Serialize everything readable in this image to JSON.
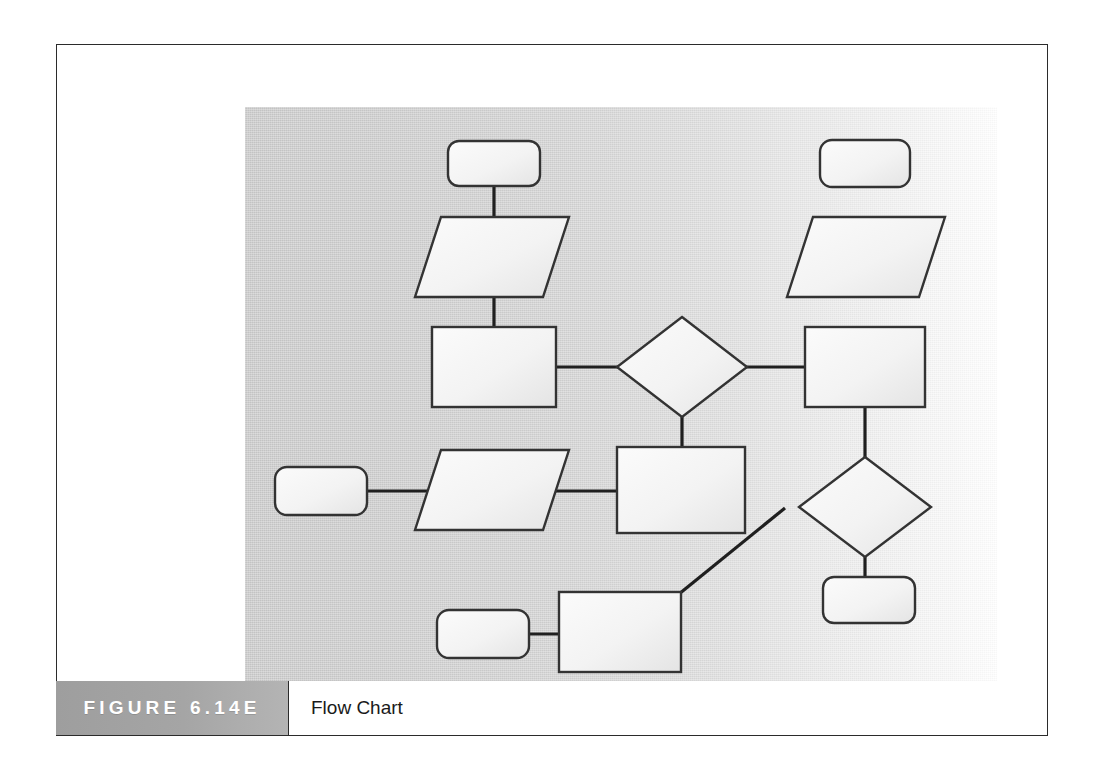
{
  "figure": {
    "badge_label": "FIGURE 6.14E",
    "caption": "Flow Chart",
    "badge_bg": "#a3a3a3",
    "badge_text_color": "#ffffff",
    "frame_border_color": "#2b2b2b"
  },
  "artwork": {
    "panel_fill_left": "#c9c9c9",
    "panel_fill_right": "#ffffff",
    "shape_fill": "#f2f2f2",
    "shape_stroke": "#333333",
    "connector_color": "#1f1f1f"
  },
  "diagram": {
    "type": "flowchart",
    "title": "Flow Chart",
    "symbol_legend": [
      {
        "symbol": "rounded-rectangle",
        "meaning": "terminator"
      },
      {
        "symbol": "parallelogram",
        "meaning": "input-output"
      },
      {
        "symbol": "rectangle",
        "meaning": "process"
      },
      {
        "symbol": "diamond",
        "meaning": "decision"
      }
    ],
    "nodes": [
      {
        "id": "n1",
        "type": "rounded-rectangle",
        "label": "",
        "x": 203,
        "y": 34,
        "w": 92,
        "h": 45
      },
      {
        "id": "n2",
        "type": "parallelogram",
        "label": "",
        "x": 170,
        "y": 110,
        "w": 154,
        "h": 80
      },
      {
        "id": "n3",
        "type": "rectangle",
        "label": "",
        "x": 187,
        "y": 220,
        "w": 124,
        "h": 80
      },
      {
        "id": "n4",
        "type": "diamond",
        "label": "",
        "x": 372,
        "y": 210,
        "w": 130,
        "h": 100
      },
      {
        "id": "n5",
        "type": "rectangle",
        "label": "",
        "x": 560,
        "y": 220,
        "w": 120,
        "h": 80
      },
      {
        "id": "n6",
        "type": "rounded-rectangle",
        "label": "",
        "x": 575,
        "y": 33,
        "w": 90,
        "h": 47
      },
      {
        "id": "n7",
        "type": "parallelogram",
        "label": "",
        "x": 542,
        "y": 110,
        "w": 158,
        "h": 80
      },
      {
        "id": "n8",
        "type": "diamond",
        "label": "",
        "x": 538,
        "y": 350,
        "w": 130,
        "h": 100
      },
      {
        "id": "n9",
        "type": "rounded-rectangle",
        "label": "",
        "x": 578,
        "y": 470,
        "w": 92,
        "h": 46
      },
      {
        "id": "n10",
        "type": "rounded-rectangle",
        "label": "",
        "x": 30,
        "y": 360,
        "w": 92,
        "h": 48
      },
      {
        "id": "n11",
        "type": "parallelogram",
        "label": "",
        "x": 170,
        "y": 343,
        "w": 154,
        "h": 80
      },
      {
        "id": "n12",
        "type": "rectangle",
        "label": "",
        "x": 372,
        "y": 340,
        "w": 128,
        "h": 86
      },
      {
        "id": "n13",
        "type": "rounded-rectangle",
        "label": "",
        "x": 192,
        "y": 503,
        "w": 92,
        "h": 48
      },
      {
        "id": "n14",
        "type": "rectangle",
        "label": "",
        "x": 314,
        "y": 485,
        "w": 122,
        "h": 80
      }
    ],
    "edges": [
      {
        "from": "n1",
        "to": "n2",
        "kind": "vertical"
      },
      {
        "from": "n2",
        "to": "n3",
        "kind": "vertical"
      },
      {
        "from": "n3",
        "to": "n4",
        "kind": "horizontal"
      },
      {
        "from": "n4",
        "to": "n5",
        "kind": "horizontal"
      },
      {
        "from": "n4",
        "to": "n12",
        "kind": "vertical"
      },
      {
        "from": "n5",
        "to": "n8",
        "kind": "vertical"
      },
      {
        "from": "n8",
        "to": "n9",
        "kind": "vertical"
      },
      {
        "from": "n10",
        "to": "n11",
        "kind": "horizontal"
      },
      {
        "from": "n11",
        "to": "n12",
        "kind": "horizontal"
      },
      {
        "from": "n13",
        "to": "n14",
        "kind": "horizontal"
      },
      {
        "from": "n14",
        "to": "n8",
        "kind": "diagonal"
      }
    ]
  }
}
